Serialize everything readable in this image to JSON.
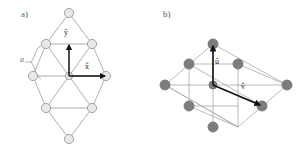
{
  "figure": {
    "width": 306,
    "height": 166,
    "background": "#ffffff",
    "panels": [
      {
        "id": "panel-a",
        "label": "a)",
        "description": "triangular lattice unit cell with cartesian basis vectors",
        "node_style": {
          "fill": "#e8e8e8",
          "stroke": "#9a9a9a",
          "radius": 4.6
        },
        "bond_color": "#9a9a9a",
        "bond_width": 0.8,
        "center": [
          69,
          76
        ],
        "nodes": [
          [
            69,
            13
          ],
          [
            46,
            44
          ],
          [
            92,
            44
          ],
          [
            33,
            76
          ],
          [
            69,
            76
          ],
          [
            106,
            76
          ],
          [
            46,
            108
          ],
          [
            92,
            108
          ],
          [
            69,
            139
          ]
        ],
        "bonds": [
          [
            [
              69,
              13
            ],
            [
              46,
              44
            ]
          ],
          [
            [
              69,
              13
            ],
            [
              92,
              44
            ]
          ],
          [
            [
              46,
              44
            ],
            [
              92,
              44
            ]
          ],
          [
            [
              46,
              44
            ],
            [
              33,
              76
            ]
          ],
          [
            [
              46,
              44
            ],
            [
              69,
              76
            ]
          ],
          [
            [
              46,
              44
            ],
            [
              92,
              44
            ]
          ],
          [
            [
              92,
              44
            ],
            [
              69,
              76
            ]
          ],
          [
            [
              92,
              44
            ],
            [
              106,
              76
            ]
          ],
          [
            [
              33,
              76
            ],
            [
              69,
              76
            ]
          ],
          [
            [
              69,
              76
            ],
            [
              106,
              76
            ]
          ],
          [
            [
              33,
              76
            ],
            [
              46,
              108
            ]
          ],
          [
            [
              69,
              76
            ],
            [
              46,
              108
            ]
          ],
          [
            [
              69,
              76
            ],
            [
              92,
              108
            ]
          ],
          [
            [
              106,
              76
            ],
            [
              92,
              108
            ]
          ],
          [
            [
              46,
              108
            ],
            [
              92,
              108
            ]
          ],
          [
            [
              46,
              108
            ],
            [
              69,
              139
            ]
          ],
          [
            [
              92,
              108
            ],
            [
              69,
              139
            ]
          ]
        ],
        "vectors": [
          {
            "name": "y-hat",
            "label": "ŷ",
            "from": [
              69,
              76
            ],
            "to": [
              69,
              44
            ],
            "color": "#111111"
          },
          {
            "name": "x-hat",
            "label": "x̂",
            "from": [
              69,
              76
            ],
            "to": [
              106,
              76
            ],
            "color": "#111111"
          }
        ],
        "annotation": {
          "name": "lattice-constant-brace",
          "label": "a",
          "color": "#6a6a6a",
          "marks_edge": [
            [
              46,
              44
            ],
            [
              33,
              76
            ]
          ]
        }
      },
      {
        "id": "panel-b",
        "label": "b)",
        "description": "sheared rhombic lattice with oblique basis vectors",
        "node_style": {
          "fill": "#7a7a7a",
          "stroke": "#6a6a6a",
          "radius": 5.0
        },
        "bond_color": "#a0a0a0",
        "bond_width": 0.8,
        "center": [
          225,
          85
        ],
        "nodes": [
          [
            213,
            44
          ],
          [
            177,
            62
          ],
          [
            251,
            62
          ],
          [
            165,
            85
          ],
          [
            213,
            85
          ],
          [
            225,
            85
          ],
          [
            287,
            85
          ],
          [
            189,
            108
          ],
          [
            262,
            108
          ],
          [
            213,
            127
          ]
        ],
        "vectors": [
          {
            "name": "u-hat",
            "label": "û",
            "from": [
              225,
              85
            ],
            "to": [
              213,
              46
            ],
            "color": "#111111"
          },
          {
            "name": "v-hat",
            "label": "v̂",
            "from": [
              225,
              85
            ],
            "to": [
              261,
              107
            ],
            "color": "#111111"
          }
        ]
      }
    ]
  }
}
